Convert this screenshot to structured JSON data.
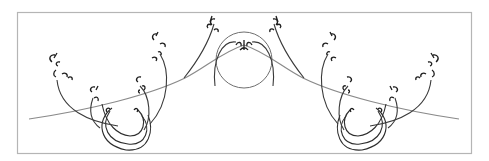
{
  "figure": {
    "colors": {
      "frame": "#b5b5b5",
      "main_curve": "#8a8a8a",
      "branches": "#2e2e2e",
      "background": "#ffffff"
    },
    "branch_groups": [
      "left-spiral",
      "center-circle",
      "right-spiral"
    ]
  }
}
